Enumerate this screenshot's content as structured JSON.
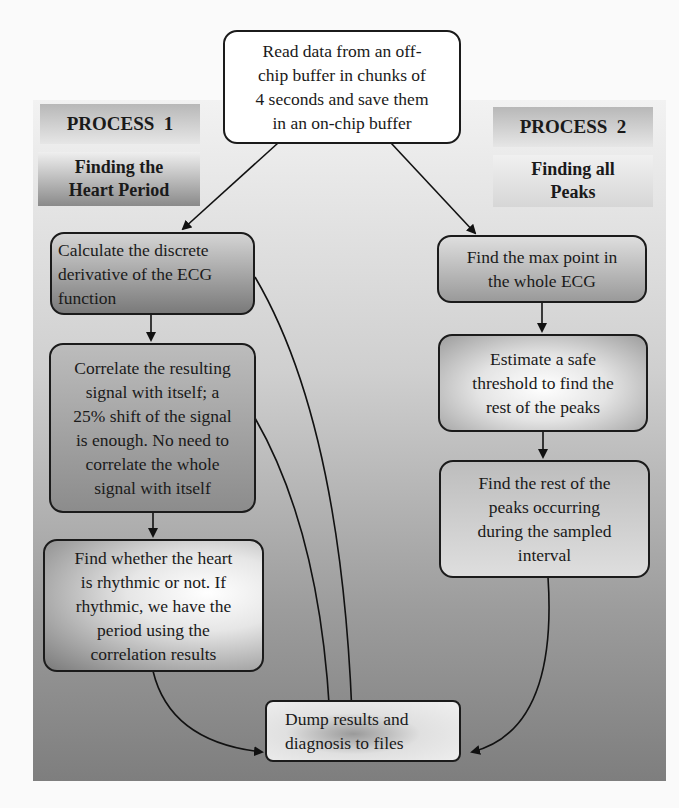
{
  "diagram": {
    "top": {
      "label": "Read data from an off-\nchip buffer in chunks of\n4 seconds and save them\nin an on-chip buffer"
    },
    "process1": {
      "title": "PROCESS  1",
      "subtitle": "Finding the\nHeart Period",
      "steps": [
        {
          "label": "Calculate the discrete\nderivative of the ECG\nfunction"
        },
        {
          "label": "Correlate the resulting\nsignal with itself; a\n25% shift of the signal\nis enough. No need to\ncorrelate the whole\nsignal with itself"
        },
        {
          "label": "Find whether the heart\nis rhythmic or not. If\nrhythmic, we have the\nperiod using the\ncorrelation results"
        }
      ]
    },
    "process2": {
      "title": "PROCESS  2",
      "subtitle": "Finding all\nPeaks",
      "steps": [
        {
          "label": "Find the max point in\nthe whole ECG"
        },
        {
          "label": "Estimate a safe\nthreshold to find the\nrest of the peaks"
        },
        {
          "label": "Find the rest of the\npeaks occurring\nduring the sampled\ninterval"
        }
      ]
    },
    "output": {
      "label": "Dump results and\ndiagnosis to files"
    }
  }
}
